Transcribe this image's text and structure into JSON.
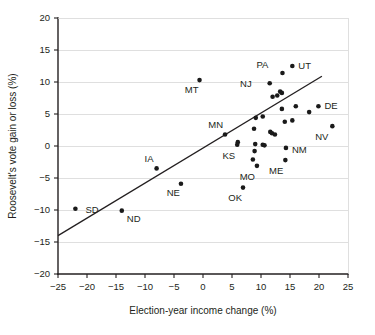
{
  "chart_data": {
    "type": "scatter",
    "title": "",
    "xlabel": "Election-year income change (%)",
    "ylabel": "Roosevelt's vote gain or loss (%)",
    "xlim": [
      -25,
      25
    ],
    "ylim": [
      -20,
      20
    ],
    "xticks": [
      "−25",
      "−20",
      "−15",
      "−10",
      "−5",
      "0",
      "5",
      "10",
      "15",
      "20",
      "25"
    ],
    "xtick_values": [
      -25,
      -20,
      -15,
      -10,
      -5,
      0,
      5,
      10,
      15,
      20,
      25
    ],
    "yticks": [
      "20",
      "15",
      "10",
      "5",
      "0",
      "−5",
      "−10",
      "−15",
      "−20"
    ],
    "ytick_values": [
      20,
      15,
      10,
      5,
      0,
      -5,
      -10,
      -15,
      -20
    ],
    "grid": "horizontal",
    "legend": "none",
    "marker_color": "#1a1a1a",
    "grid_color": "#d2d2d2",
    "axis_color": "#231f20",
    "trend_line": {
      "x0": -25,
      "y0": -14.0,
      "x1": 20.5,
      "y1": 10.9,
      "label": "fitted-trend-line"
    },
    "points": [
      {
        "label": "SD",
        "x": -22.0,
        "y": -9.8,
        "lx": 10,
        "ly": 4
      },
      {
        "label": "ND",
        "x": -14.0,
        "y": -10.1,
        "lx": 5,
        "ly": 11
      },
      {
        "label": "IA",
        "x": -8.0,
        "y": -3.5,
        "lx": -3,
        "ly": -6
      },
      {
        "label": "NE",
        "x": -3.8,
        "y": -5.9,
        "lx": -1,
        "ly": 12
      },
      {
        "label": "MT",
        "x": -0.6,
        "y": 10.3,
        "lx": -1,
        "ly": 13
      },
      {
        "label": "MN",
        "x": 3.8,
        "y": 1.8,
        "lx": -2,
        "ly": -6
      },
      {
        "label": "KS",
        "x": 5.9,
        "y": 0.2,
        "lx": -2,
        "ly": 14
      },
      {
        "label": "",
        "x": 6.0,
        "y": 0.6,
        "lx": 0,
        "ly": 0
      },
      {
        "label": "OK",
        "x": 6.9,
        "y": -6.5,
        "lx": -1,
        "ly": 13
      },
      {
        "label": "",
        "x": 8.6,
        "y": -2.1,
        "lx": 0,
        "ly": 0
      },
      {
        "label": "MO",
        "x": 9.3,
        "y": -3.1,
        "lx": -2,
        "ly": 14
      },
      {
        "label": "",
        "x": 8.9,
        "y": -0.8,
        "lx": 0,
        "ly": 0
      },
      {
        "label": "",
        "x": 9.0,
        "y": 0.3,
        "lx": 0,
        "ly": 0
      },
      {
        "label": "",
        "x": 8.8,
        "y": 2.7,
        "lx": 0,
        "ly": 0
      },
      {
        "label": "",
        "x": 9.1,
        "y": 4.4,
        "lx": 0,
        "ly": 0
      },
      {
        "label": "",
        "x": 10.3,
        "y": 4.6,
        "lx": 0,
        "ly": 0
      },
      {
        "label": "",
        "x": 10.3,
        "y": 0.2,
        "lx": 0,
        "ly": 0
      },
      {
        "label": "",
        "x": 10.6,
        "y": 0.1,
        "lx": 0,
        "ly": 0
      },
      {
        "label": "NJ",
        "x": 11.5,
        "y": 9.8,
        "lx": -18,
        "ly": 4
      },
      {
        "label": "",
        "x": 11.6,
        "y": 2.2,
        "lx": 0,
        "ly": 0
      },
      {
        "label": "",
        "x": 11.9,
        "y": 2.0,
        "lx": 0,
        "ly": 0
      },
      {
        "label": "",
        "x": 12.0,
        "y": 7.7,
        "lx": 0,
        "ly": 0
      },
      {
        "label": "",
        "x": 12.4,
        "y": 1.8,
        "lx": 0,
        "ly": 0
      },
      {
        "label": "",
        "x": 12.8,
        "y": 7.9,
        "lx": 0,
        "ly": 0
      },
      {
        "label": "PA",
        "x": 13.7,
        "y": 11.4,
        "lx": -14,
        "ly": -5
      },
      {
        "label": "",
        "x": 13.3,
        "y": 8.5,
        "lx": 0,
        "ly": 0
      },
      {
        "label": "",
        "x": 13.6,
        "y": 8.3,
        "lx": 0,
        "ly": 0
      },
      {
        "label": "",
        "x": 13.6,
        "y": 5.8,
        "lx": 0,
        "ly": 0
      },
      {
        "label": "ME",
        "x": 14.2,
        "y": -2.2,
        "lx": -2,
        "ly": 14
      },
      {
        "label": "NM",
        "x": 14.3,
        "y": -0.3,
        "lx": 6,
        "ly": 5
      },
      {
        "label": "",
        "x": 14.1,
        "y": 3.8,
        "lx": 0,
        "ly": 0
      },
      {
        "label": "UT",
        "x": 15.4,
        "y": 12.5,
        "lx": 6,
        "ly": 3
      },
      {
        "label": "",
        "x": 15.4,
        "y": 4.0,
        "lx": 0,
        "ly": 0
      },
      {
        "label": "",
        "x": 16.0,
        "y": 6.2,
        "lx": 0,
        "ly": 0
      },
      {
        "label": "",
        "x": 18.3,
        "y": 5.3,
        "lx": 0,
        "ly": 0
      },
      {
        "label": "DE",
        "x": 19.9,
        "y": 6.2,
        "lx": 6,
        "ly": 3
      },
      {
        "label": "NV",
        "x": 22.3,
        "y": 3.1,
        "lx": -4,
        "ly": 14
      }
    ]
  }
}
